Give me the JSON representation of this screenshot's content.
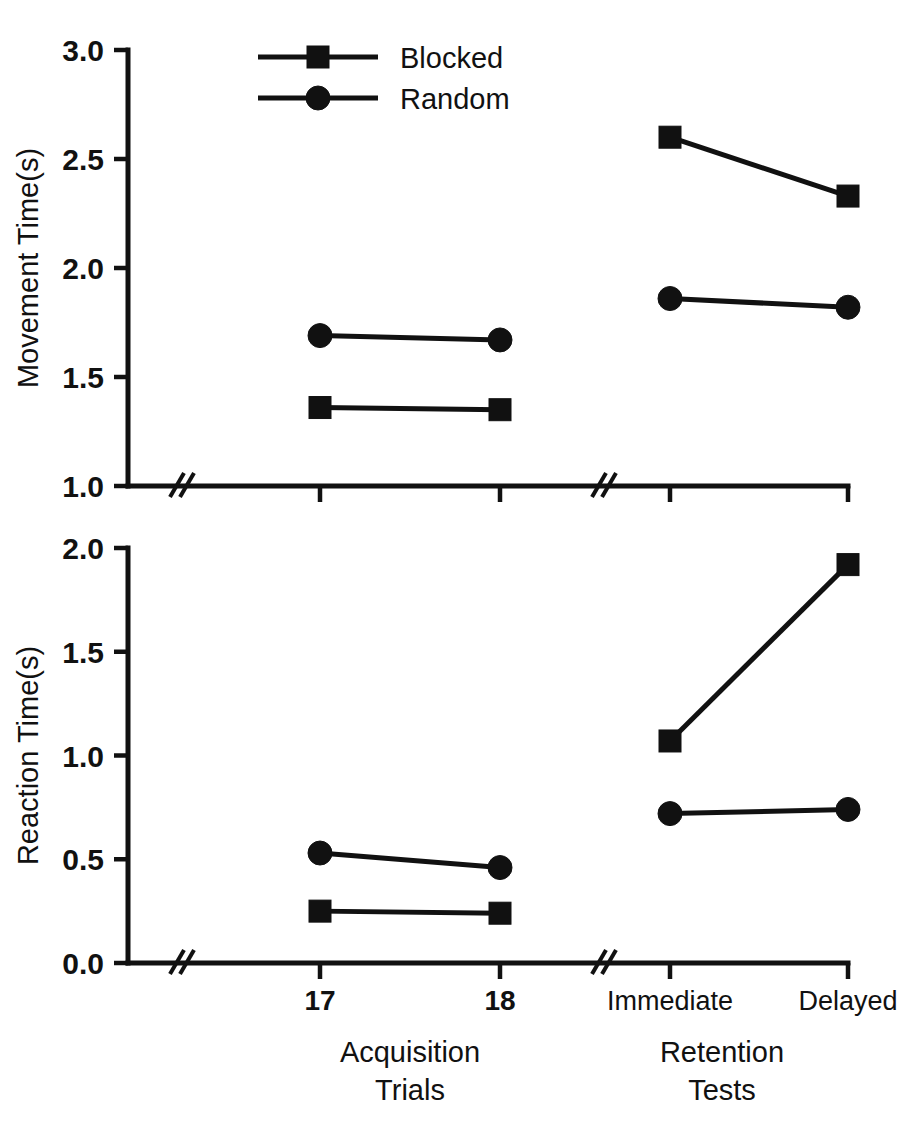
{
  "figure": {
    "background_color": "#ffffff",
    "ink_color": "#111111"
  },
  "legend": {
    "position": "top-center-left",
    "entries": [
      {
        "label": "Blocked",
        "marker": "filled-square-marker"
      },
      {
        "label": "Random",
        "marker": "filled-circle-marker"
      }
    ]
  },
  "x_axis": {
    "tick_labels": [
      "17",
      "18",
      "Immediate",
      "Delayed"
    ],
    "group_labels": [
      {
        "line1": "Acquisition",
        "line2": "Trials"
      },
      {
        "line1": "Retention",
        "line2": "Tests"
      }
    ],
    "has_axis_break": true,
    "break_symbol": "//"
  },
  "chart_data": [
    {
      "type": "line",
      "title": "",
      "xlabel": "",
      "ylabel": "Movement Time(s)",
      "categories": [
        "17",
        "18",
        "Immediate",
        "Delayed"
      ],
      "x_groups": [
        "Acquisition Trials",
        "Acquisition Trials",
        "Retention Tests",
        "Retention Tests"
      ],
      "ylim": [
        1.0,
        3.0
      ],
      "ytick_labels": [
        "1.0",
        "1.5",
        "2.0",
        "2.5",
        "3.0"
      ],
      "ytick_values": [
        1.0,
        1.5,
        2.0,
        2.5,
        3.0
      ],
      "grid": false,
      "legend_position": "upper-left-inset",
      "axis_break_between": [
        "18",
        "Immediate"
      ],
      "series": [
        {
          "name": "Blocked",
          "marker": "square",
          "values": [
            1.36,
            1.35,
            2.6,
            2.33
          ]
        },
        {
          "name": "Random",
          "marker": "circle",
          "values": [
            1.69,
            1.67,
            1.86,
            1.82
          ]
        }
      ]
    },
    {
      "type": "line",
      "title": "",
      "xlabel": "",
      "ylabel": "Reaction Time(s)",
      "categories": [
        "17",
        "18",
        "Immediate",
        "Delayed"
      ],
      "x_groups": [
        "Acquisition Trials",
        "Acquisition Trials",
        "Retention Tests",
        "Retention Tests"
      ],
      "ylim": [
        0.0,
        2.0
      ],
      "ytick_labels": [
        "0.0",
        "0.5",
        "1.0",
        "1.5",
        "2.0"
      ],
      "ytick_values": [
        0.0,
        0.5,
        1.0,
        1.5,
        2.0
      ],
      "grid": false,
      "legend_position": "none",
      "axis_break_between": [
        "18",
        "Immediate"
      ],
      "series": [
        {
          "name": "Blocked",
          "marker": "square",
          "values": [
            0.25,
            0.24,
            1.07,
            1.92
          ]
        },
        {
          "name": "Random",
          "marker": "circle",
          "values": [
            0.53,
            0.46,
            0.72,
            0.74
          ]
        }
      ]
    }
  ]
}
